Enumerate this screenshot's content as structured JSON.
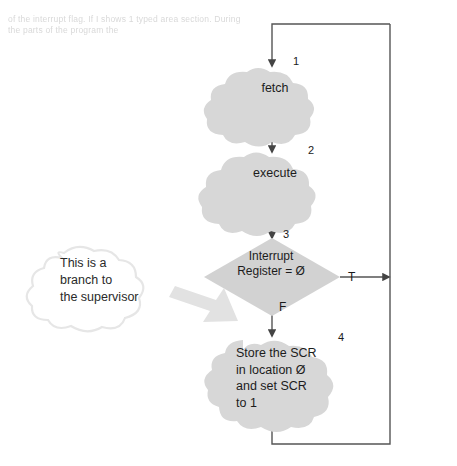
{
  "figure": {
    "type": "flowchart",
    "background": "#ffffff",
    "ghost_header_text": "of the   interrupt flag. If I shows 1 typed area section. During\nthe    parts of       the           program the   ",
    "palette": {
      "node_fill": "#d7d7d7",
      "decision_fill": "#d2d2d2",
      "line": "#555555",
      "annotation_outline": "#e6e6e6",
      "annotation_arrow": "#e0e0e0",
      "text": "#1a1a1a",
      "ghost_text": "#d9d9d9"
    }
  },
  "nodes": [
    {
      "id": "fetch",
      "shape": "cloud",
      "number": "1",
      "label": "fetch"
    },
    {
      "id": "execute",
      "shape": "cloud",
      "number": "2",
      "label": "execute"
    },
    {
      "id": "decision",
      "shape": "diamond",
      "number": "3",
      "label": "Interrupt\nRegister = Ø"
    },
    {
      "id": "store",
      "shape": "cloud",
      "number": "4",
      "label": "Store the SCR\nin location Ø\nand set SCR\nto 1"
    }
  ],
  "branches": {
    "true_label": "T",
    "false_label": "F"
  },
  "annotation": {
    "shape": "cloud-callout",
    "text": "This is a\nbranch to\nthe supervisor"
  }
}
